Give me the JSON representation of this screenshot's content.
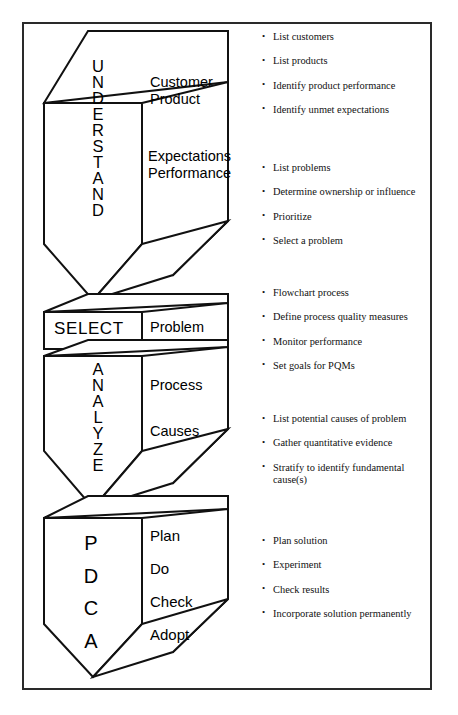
{
  "diagram": {
    "stroke_color": "#111111",
    "frame_color": "#2a2a2a",
    "background": "#ffffff",
    "stages": [
      {
        "id": "understand",
        "name": "UNDERSTAND",
        "letters": [
          "U",
          "N",
          "D",
          "E",
          "R",
          "S",
          "T",
          "A",
          "N",
          "D"
        ],
        "items_group_a": [
          "Customer",
          "Product"
        ],
        "items_group_b": [
          "Expectations",
          "Performance"
        ],
        "shape": "funnel-box"
      },
      {
        "id": "select",
        "name": "SELECT",
        "letters": [
          "S",
          "E",
          "L",
          "E",
          "C",
          "T"
        ],
        "items_group_a": [
          "Problem"
        ],
        "items_group_b": [],
        "shape": "slab"
      },
      {
        "id": "analyze",
        "name": "ANALYZE",
        "letters": [
          "A",
          "N",
          "A",
          "L",
          "Y",
          "Z",
          "E"
        ],
        "items_group_a": [
          "Process"
        ],
        "items_group_b": [
          "Causes"
        ],
        "shape": "funnel-box"
      },
      {
        "id": "pdca",
        "name": "PDCA",
        "letters": [
          "P",
          "D",
          "C",
          "A"
        ],
        "items_group_a": [
          "Plan",
          "Do",
          "Check",
          "Adopt"
        ],
        "items_group_b": [],
        "shape": "funnel-box"
      }
    ]
  },
  "bullet_groups": [
    {
      "stage": "understand",
      "items": [
        "List customers",
        "List products",
        "Identify product performance",
        "Identify unmet expectations"
      ]
    },
    {
      "stage": "select",
      "items": [
        "List problems",
        "Determine ownership or influence",
        "Prioritize",
        "Select a problem"
      ]
    },
    {
      "stage": "analyze-process",
      "items": [
        "Flowchart process",
        "Define process quality measures",
        "Monitor performance",
        "Set goals for PQMs"
      ]
    },
    {
      "stage": "analyze-causes",
      "items": [
        "List potential causes of problem",
        "Gather quantitative evidence",
        "Stratify to identify fundamental cause(s)"
      ]
    },
    {
      "stage": "pdca",
      "items": [
        "Plan solution",
        "Experiment",
        "Check results",
        "Incorporate solution permanently"
      ]
    }
  ]
}
